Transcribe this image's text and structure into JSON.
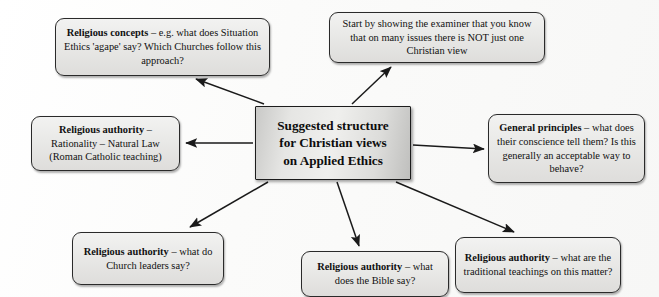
{
  "diagram": {
    "type": "mind-map",
    "title": "Suggested structure for Christian views on Applied Ethics",
    "center": {
      "id": "center-node",
      "line1": "Suggested structure",
      "line2": "for Christian views",
      "line3": "on Applied Ethics"
    },
    "nodes": [
      {
        "id": "n-top-left",
        "name": "node-religious-concepts",
        "lead": "Religious concepts",
        "body": " – e.g. what does Situation Ethics 'agape' say? Which Churches follow this approach?"
      },
      {
        "id": "n-top-right",
        "name": "node-start-by-showing",
        "lead": "",
        "body": "Start by showing the examiner that you know that on many issues there is NOT just one Christian view"
      },
      {
        "id": "n-left",
        "name": "node-religious-authority-natural-law",
        "lead": "Religious authority",
        "body": " – Rationality – Natural Law (Roman Catholic teaching)"
      },
      {
        "id": "n-right",
        "name": "node-general-principles",
        "lead": "General principles",
        "body": " – what does their conscience tell them? Is this generally an acceptable way to behave?"
      },
      {
        "id": "n-bottom-left",
        "name": "node-religious-authority-church-leaders",
        "lead": "Religious authority",
        "body": " – what do Church leaders say?"
      },
      {
        "id": "n-bottom-mid",
        "name": "node-religious-authority-bible",
        "lead": "Religious authority",
        "body": " – what does the Bible say?"
      },
      {
        "id": "n-bottom-right",
        "name": "node-religious-authority-traditional-teachings",
        "lead": "Religious authority",
        "body": " – what are the traditional teachings on this matter?"
      }
    ],
    "arrows": [
      {
        "name": "arrow-center-to-top-left",
        "from": "center-node",
        "to": "n-top-left"
      },
      {
        "name": "arrow-center-to-top-right",
        "from": "center-node",
        "to": "n-top-right"
      },
      {
        "name": "arrow-center-to-left",
        "from": "center-node",
        "to": "n-left"
      },
      {
        "name": "arrow-center-to-right",
        "from": "center-node",
        "to": "n-right"
      },
      {
        "name": "arrow-center-to-bottom-left",
        "from": "center-node",
        "to": "n-bottom-left"
      },
      {
        "name": "arrow-center-to-bottom-mid",
        "from": "center-node",
        "to": "n-bottom-mid"
      },
      {
        "name": "arrow-center-to-bottom-right",
        "from": "center-node",
        "to": "n-bottom-right"
      }
    ],
    "colors": {
      "page_background": "#fdfdfc",
      "node_fill": "#e9e9e7",
      "node_border": "#2a2a2a",
      "center_fill": "#e6e6e4",
      "arrow": "#1a1a1a",
      "text": "#111111"
    }
  }
}
